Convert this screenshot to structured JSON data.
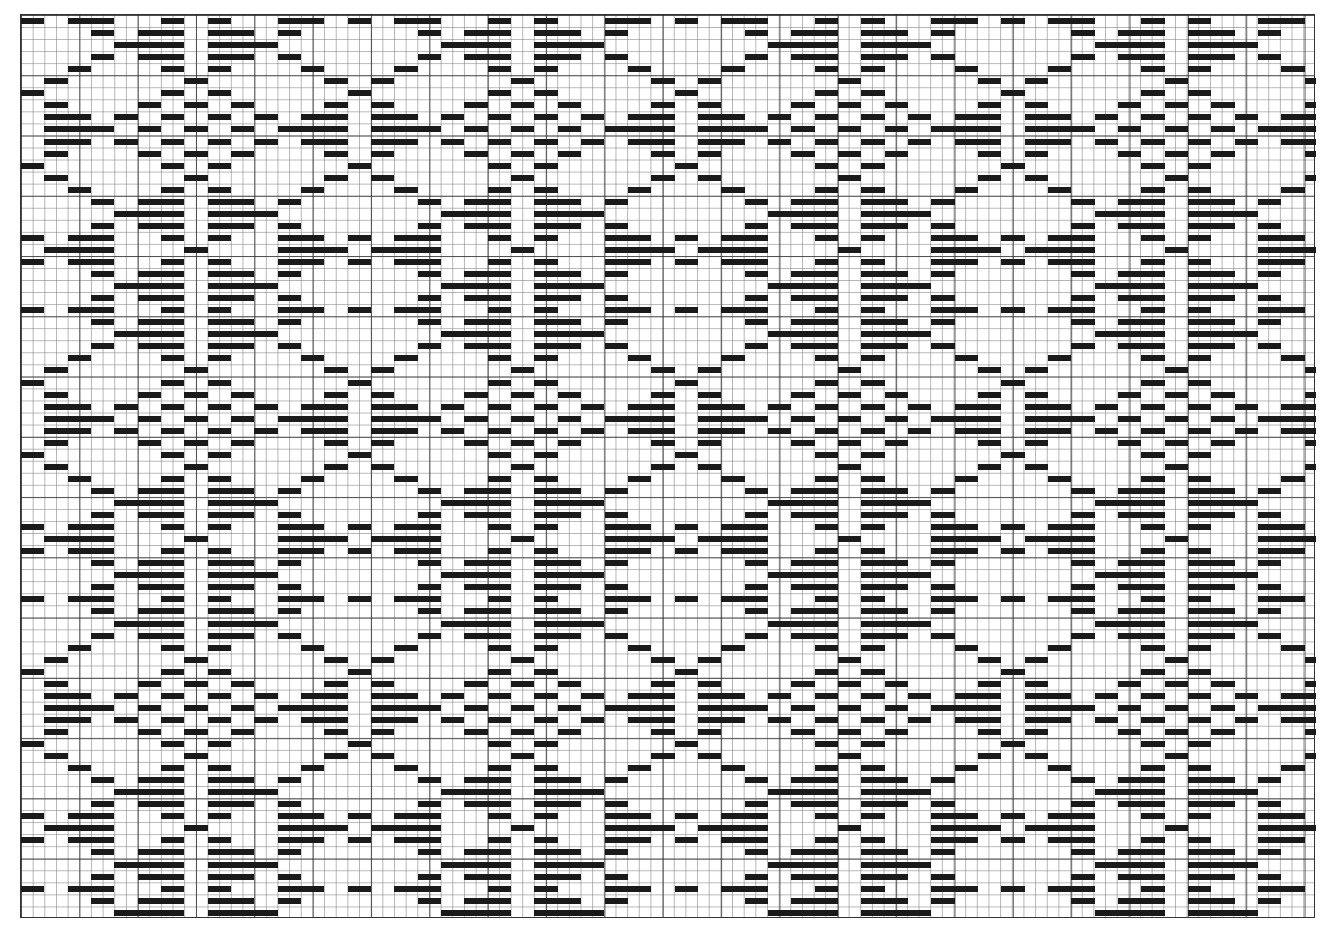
{
  "draft": {
    "type": "weaving-draft-grid",
    "columns": 111,
    "rows": 75,
    "cell_width": 11.67,
    "cell_height": 12.05,
    "bold_line_every": 5,
    "colors": {
      "bar": "#1a1a1a",
      "grid": "#787878",
      "background": "#ffffff"
    },
    "motif_period": {
      "cols": 28,
      "rows": 24
    },
    "motif_rows": [
      [
        [
          0,
          1
        ],
        [
          4,
          7
        ],
        [
          12,
          13
        ],
        [
          16,
          17
        ],
        [
          22,
          25
        ]
      ],
      [
        [
          6,
          7
        ],
        [
          10,
          13
        ],
        [
          16,
          19
        ],
        [
          22,
          23
        ]
      ],
      [
        [
          8,
          13
        ],
        [
          16,
          21
        ]
      ],
      [
        [
          6,
          7
        ],
        [
          10,
          13
        ],
        [
          16,
          19
        ],
        [
          22,
          23
        ]
      ],
      [
        [
          4,
          5
        ],
        [
          12,
          13
        ],
        [
          16,
          17
        ],
        [
          24,
          25
        ]
      ],
      [
        [
          2,
          3
        ],
        [
          14,
          15
        ],
        [
          26,
          27
        ]
      ],
      [
        [
          0,
          1
        ],
        [
          12,
          13
        ],
        [
          16,
          17
        ]
      ],
      [
        [
          2,
          3
        ],
        [
          10,
          11
        ],
        [
          14,
          15
        ],
        [
          18,
          19
        ],
        [
          26,
          27
        ]
      ],
      [
        [
          2,
          5
        ],
        [
          8,
          9
        ],
        [
          12,
          13
        ],
        [
          16,
          17
        ],
        [
          20,
          21
        ],
        [
          24,
          27
        ]
      ],
      [
        [
          2,
          7
        ],
        [
          10,
          11
        ],
        [
          14,
          15
        ],
        [
          18,
          19
        ],
        [
          22,
          27
        ]
      ],
      [
        [
          2,
          5
        ],
        [
          8,
          9
        ],
        [
          12,
          13
        ],
        [
          16,
          17
        ],
        [
          20,
          21
        ],
        [
          24,
          27
        ]
      ],
      [
        [
          2,
          3
        ],
        [
          10,
          11
        ],
        [
          14,
          15
        ],
        [
          18,
          19
        ],
        [
          26,
          27
        ]
      ],
      [
        [
          0,
          1
        ],
        [
          12,
          13
        ],
        [
          16,
          17
        ]
      ],
      [
        [
          2,
          3
        ],
        [
          14,
          15
        ],
        [
          26,
          27
        ]
      ],
      [
        [
          4,
          5
        ],
        [
          12,
          13
        ],
        [
          16,
          17
        ],
        [
          24,
          25
        ]
      ],
      [
        [
          6,
          7
        ],
        [
          10,
          13
        ],
        [
          16,
          19
        ],
        [
          22,
          23
        ]
      ],
      [
        [
          8,
          13
        ],
        [
          16,
          21
        ]
      ],
      [
        [
          6,
          7
        ],
        [
          10,
          13
        ],
        [
          16,
          19
        ],
        [
          22,
          23
        ]
      ],
      [
        [
          0,
          1
        ],
        [
          4,
          7
        ],
        [
          12,
          13
        ],
        [
          16,
          17
        ],
        [
          22,
          25
        ]
      ],
      [
        [
          2,
          7
        ],
        [
          14,
          15
        ],
        [
          22,
          27
        ]
      ],
      [
        [
          0,
          1
        ],
        [
          4,
          7
        ],
        [
          12,
          13
        ],
        [
          16,
          17
        ],
        [
          22,
          25
        ]
      ],
      [
        [
          6,
          7
        ],
        [
          10,
          13
        ],
        [
          16,
          19
        ],
        [
          22,
          23
        ]
      ],
      [
        [
          8,
          13
        ],
        [
          16,
          21
        ]
      ],
      [
        [
          6,
          7
        ],
        [
          10,
          13
        ],
        [
          16,
          19
        ],
        [
          22,
          23
        ]
      ]
    ]
  }
}
